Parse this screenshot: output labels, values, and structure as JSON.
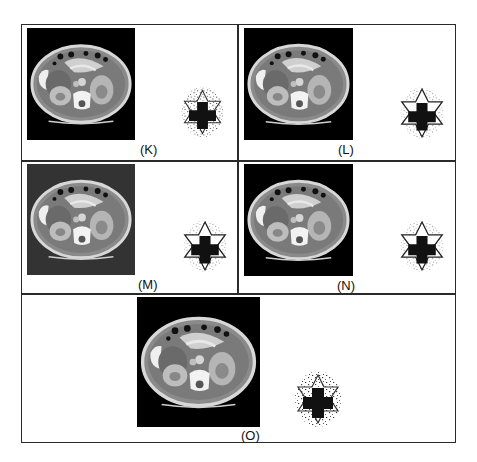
{
  "figure": {
    "border_color": "#2a2a2a",
    "panels": [
      {
        "id": "K",
        "label": "(K)",
        "ct_background": "#000000",
        "watermark_style": "noisy"
      },
      {
        "id": "L",
        "label": "(L)",
        "ct_background": "#000000",
        "watermark_style": "clean"
      },
      {
        "id": "M",
        "label": "(M)",
        "ct_background": "#333333",
        "watermark_style": "clean"
      },
      {
        "id": "N",
        "label": "(N)",
        "ct_background": "#000000",
        "watermark_style": "clean"
      },
      {
        "id": "O",
        "label": "(O)",
        "ct_background": "#000000",
        "watermark_style": "noisy"
      }
    ],
    "icons": {
      "ct_scan": "abdominal-ct-slice",
      "watermark": "star-of-david-with-cross"
    }
  }
}
